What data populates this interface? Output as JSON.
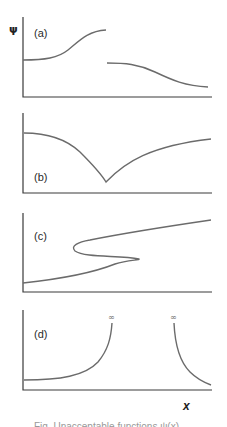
{
  "figure": {
    "y_axis_label": "ψ",
    "x_axis_label": "x",
    "panels": [
      {
        "label": "(a)",
        "description": "discontinuous function"
      },
      {
        "label": "(b)",
        "description": "function with discontinuous slope (cusp)"
      },
      {
        "label": "(c)",
        "description": "multi-valued function"
      },
      {
        "label": "(d)",
        "description": "function that becomes infinite"
      }
    ],
    "infinity_markers": [
      "∞",
      "∞"
    ],
    "caption": "Fig. Unacceptable functions ψ(x)"
  },
  "colors": {
    "axis": "#3a3a3a",
    "curve": "#6b6b6b",
    "background": "#ffffff"
  }
}
